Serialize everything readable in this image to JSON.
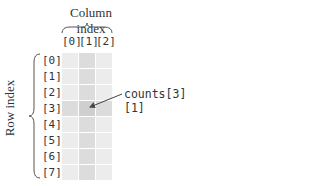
{
  "diagram": {
    "column_title": "Column index",
    "row_title": "Row index",
    "column_labels": [
      "[0]",
      "[1]",
      "[2]"
    ],
    "row_labels": [
      "[0]",
      "[1]",
      "[2]",
      "[3]",
      "[4]",
      "[5]",
      "[6]",
      "[7]"
    ],
    "rows": 8,
    "columns": 3,
    "highlight": {
      "row": 3,
      "column": 1
    },
    "callout": "counts[3][1]",
    "colors": {
      "cell": "#ececec",
      "highlight_line": "#dcdcdc",
      "highlight_cell": "#cfcfcf",
      "text": "#333333"
    }
  }
}
